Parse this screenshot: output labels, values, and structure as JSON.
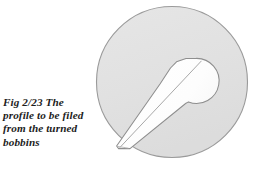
{
  "figure": {
    "caption": {
      "lines": [
        "Fig 2/23  The",
        "profile to be filed",
        "from the turned",
        "bobbins"
      ],
      "full_text": "Fig 2/23 The profile to be filed from the turned bobbins",
      "figure_number": "2/23"
    },
    "colors": {
      "background": "#ffffff",
      "disc_fill": "#e2e2e2",
      "disc_stroke": "#9a9a9a",
      "cutout_fill": "#ffffff",
      "cutout_stroke": "#8e8e8e",
      "profile_line": "#a6a6a6",
      "caption_text": "#1d1d1d"
    },
    "geometry": {
      "canvas_width": 259,
      "canvas_height": 169,
      "disc_center_x": 172,
      "disc_center_y": 82,
      "disc_radius": 76,
      "lobe_center_x": 190,
      "lobe_center_y": 80,
      "lobe_radius": 22,
      "stem_tip_x": 118,
      "stem_tip_y": 148
    },
    "shape_names": {
      "disc": "bobbin-disc",
      "cutout": "filed-profile-cutout",
      "profile_line": "profile-edge-line"
    }
  }
}
